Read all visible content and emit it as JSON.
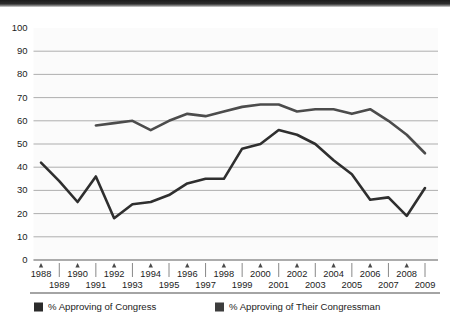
{
  "chart_data": {
    "type": "line",
    "title": "",
    "subtitle": "",
    "xlabel": "",
    "ylabel": "",
    "xlim": [
      1988,
      2009
    ],
    "ylim": [
      0,
      100
    ],
    "grid": true,
    "legend_position": "bottom",
    "ytick_labels": [
      "100",
      "90",
      "80",
      "70",
      "60",
      "50",
      "40",
      "30",
      "20",
      "10",
      "0"
    ],
    "yticks": [
      100,
      90,
      80,
      70,
      60,
      50,
      40,
      30,
      20,
      10,
      0
    ],
    "categories": [
      "1988",
      "1989",
      "1990",
      "1991",
      "1992",
      "1993",
      "1994",
      "1995",
      "1996",
      "1997",
      "1998",
      "1999",
      "2000",
      "2001",
      "2002",
      "2003",
      "2004",
      "2005",
      "2006",
      "2007",
      "2008",
      "2009"
    ],
    "x": [
      1988,
      1989,
      1990,
      1991,
      1992,
      1993,
      1994,
      1995,
      1996,
      1997,
      1998,
      1999,
      2000,
      2001,
      2002,
      2003,
      2004,
      2005,
      2006,
      2007,
      2008,
      2009
    ],
    "series": [
      {
        "name": "% Approving of Congress",
        "color": "#2f2f2f",
        "values": [
          42,
          34,
          25,
          36,
          18,
          24,
          25,
          28,
          33,
          35,
          35,
          48,
          50,
          56,
          54,
          50,
          43,
          37,
          26,
          27,
          19,
          31
        ]
      },
      {
        "name": "% Approving of Their Congressman",
        "color": "#4c4c4c",
        "values": [
          null,
          null,
          null,
          58,
          59,
          60,
          56,
          60,
          63,
          62,
          64,
          66,
          67,
          67,
          64,
          65,
          65,
          63,
          65,
          60,
          54,
          46
        ]
      }
    ],
    "legend": [
      {
        "label": "% Approving of Congress",
        "color": "#2b2b2b",
        "swatch": "square-swatch"
      },
      {
        "label": "% Approving of Their Congressman",
        "color": "#3d3d3d",
        "swatch": "square-swatch"
      }
    ]
  }
}
